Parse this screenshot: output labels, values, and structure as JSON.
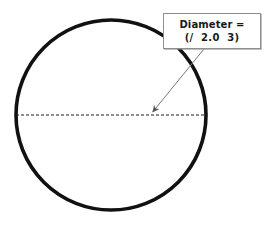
{
  "figure": {
    "background_color": "#ffffff",
    "circle": {
      "name": "circle-outline",
      "center_x": 111,
      "center_y": 115,
      "radius": 95,
      "stroke_color": "#111111",
      "stroke_width": 3.6,
      "fill": "none"
    },
    "diameter_line": {
      "name": "diameter-dashed-line",
      "x1": 16,
      "y1": 115,
      "x2": 206,
      "y2": 115,
      "stroke_color": "#1a1a1a",
      "stroke_width": 1,
      "dash_pattern": "3 2"
    },
    "leader_arrow": {
      "name": "callout-leader-arrow",
      "x1": 204,
      "y1": 49,
      "x2": 151,
      "y2": 114,
      "stroke_color": "#777777",
      "stroke_width": 1,
      "arrowhead_color": "#555555",
      "points_to": "circle-center"
    }
  },
  "callout": {
    "label": "Diameter callout",
    "line_1": "Diameter =",
    "line_2": "(/  2.0  3)",
    "border_color": "#8e8e8e",
    "background_color": "#ffffff",
    "text_color": "#1a1a1a"
  }
}
